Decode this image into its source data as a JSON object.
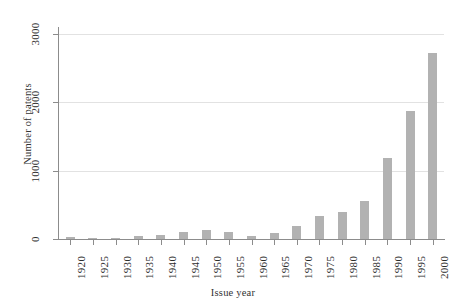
{
  "chart_data": {
    "type": "bar",
    "title": "",
    "xlabel": "Issue year",
    "ylabel": "Number of patents",
    "categories": [
      "1920",
      "1925",
      "1930",
      "1935",
      "1940",
      "1945",
      "1950",
      "1955",
      "1960",
      "1965",
      "1970",
      "1975",
      "1980",
      "1985",
      "1990",
      "1995",
      "2000"
    ],
    "values": [
      30,
      15,
      20,
      45,
      60,
      105,
      135,
      100,
      50,
      90,
      190,
      340,
      390,
      560,
      1190,
      1865,
      2725
    ],
    "series": [
      {
        "name": "Number of patents",
        "values": [
          30,
          15,
          20,
          45,
          60,
          105,
          135,
          100,
          50,
          90,
          190,
          340,
          390,
          560,
          1190,
          1865,
          2725
        ]
      }
    ],
    "ylim": [
      0,
      3100
    ],
    "yticks": [
      0,
      1000,
      2000,
      3000
    ],
    "ytick_labels": [
      "0",
      "1000",
      "2000",
      "3000"
    ],
    "grid": "horizontal",
    "legend": "none",
    "bar_color": "#b2b2b2",
    "grid_color": "#e2e2e2",
    "axis_color": "#8c8c8c",
    "panel_background": "#ffffff"
  }
}
